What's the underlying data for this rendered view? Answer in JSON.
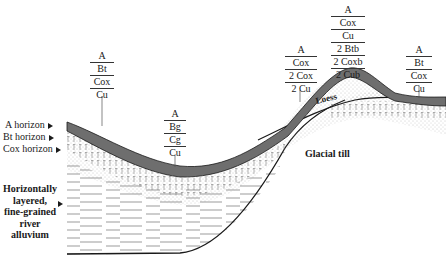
{
  "side_labels": {
    "a_horizon": "A horizon",
    "bt_horizon": "Bt horizon",
    "cox_horizon": "Cox horizon",
    "alluvium": [
      "Horizontally",
      "layered,",
      "fine-grained",
      "river alluvium"
    ]
  },
  "profiles": [
    {
      "id": "upland-left",
      "horizons": [
        "A",
        "Bt",
        "Cox",
        "Cu"
      ]
    },
    {
      "id": "lowland",
      "horizons": [
        "A",
        "Bg",
        "Cg",
        "Cu"
      ]
    },
    {
      "id": "slope",
      "horizons": [
        "A",
        "Cox",
        "2 Cox",
        "2 Cu"
      ]
    },
    {
      "id": "summit",
      "horizons": [
        "A",
        "Cox",
        "Cu",
        "2 Btb",
        "2 Coxb",
        "2 Cub"
      ]
    },
    {
      "id": "upland-right",
      "horizons": [
        "A",
        "Bt",
        "Cox",
        "Cu"
      ]
    }
  ],
  "materials": {
    "loess": "Loess",
    "glacial_till": "Glacial till"
  },
  "colors": {
    "a_horizon": "#6e6e6e",
    "line": "#1a1a1a",
    "stipple": "#9a9a9a"
  }
}
